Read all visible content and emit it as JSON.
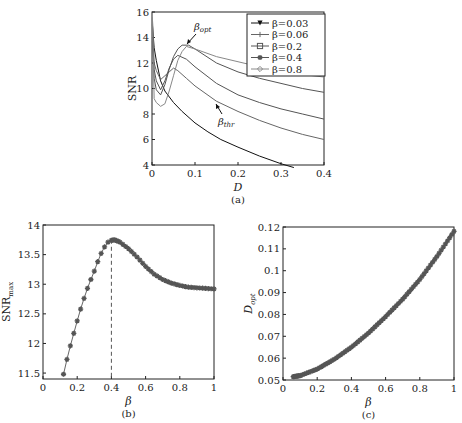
{
  "chart_data": [
    {
      "id": "a",
      "type": "line",
      "caption": "(a)",
      "xlabel": "D",
      "ylabel": "SNR",
      "xlim": [
        0,
        0.4
      ],
      "ylim": [
        4,
        16
      ],
      "xticks": [
        "0",
        "0.1",
        "0.2",
        "0.3",
        "0.4"
      ],
      "yticks": [
        "4",
        "6",
        "8",
        "10",
        "12",
        "14",
        "16"
      ],
      "legend_position": "upper right",
      "annotations": [
        {
          "text": "β_opt",
          "x": 0.085,
          "y": 13.4
        },
        {
          "text": "β_thr",
          "x": 0.155,
          "y": 8.6
        }
      ],
      "series": [
        {
          "name": "β=0.03",
          "marker": "triangle-down",
          "x": [
            0.001,
            0.005,
            0.01,
            0.02,
            0.03,
            0.05,
            0.07,
            0.1,
            0.13,
            0.16,
            0.2,
            0.25,
            0.3,
            0.33
          ],
          "y": [
            15.0,
            13.2,
            12.2,
            10.6,
            9.8,
            8.9,
            8.2,
            7.3,
            6.6,
            6.0,
            5.4,
            4.7,
            4.1,
            3.8
          ]
        },
        {
          "name": "β=0.06",
          "marker": "plus",
          "x": [
            0.001,
            0.005,
            0.01,
            0.02,
            0.03,
            0.04,
            0.05,
            0.06,
            0.08,
            0.1,
            0.15,
            0.2,
            0.25,
            0.3,
            0.35,
            0.4
          ],
          "y": [
            15.5,
            12.0,
            11.4,
            10.7,
            11.0,
            11.3,
            11.6,
            11.4,
            10.8,
            10.2,
            9.0,
            8.2,
            7.5,
            6.9,
            6.4,
            6.0
          ]
        },
        {
          "name": "β=0.2",
          "marker": "square",
          "x": [
            0.001,
            0.005,
            0.01,
            0.02,
            0.03,
            0.04,
            0.05,
            0.06,
            0.08,
            0.1,
            0.15,
            0.2,
            0.25,
            0.3,
            0.35,
            0.4
          ],
          "y": [
            14.0,
            11.5,
            10.6,
            9.9,
            10.6,
            11.6,
            12.3,
            12.6,
            12.3,
            11.7,
            10.4,
            9.5,
            8.9,
            8.4,
            8.0,
            7.6
          ]
        },
        {
          "name": "β=0.4",
          "marker": "star",
          "x": [
            0.001,
            0.005,
            0.01,
            0.02,
            0.03,
            0.04,
            0.05,
            0.06,
            0.07,
            0.085,
            0.1,
            0.15,
            0.2,
            0.25,
            0.3,
            0.35,
            0.4
          ],
          "y": [
            13.7,
            10.8,
            9.9,
            9.5,
            10.3,
            11.5,
            12.5,
            13.1,
            13.4,
            13.4,
            13.1,
            12.0,
            11.3,
            10.8,
            10.4,
            10.0,
            9.7
          ]
        },
        {
          "name": "β=0.8",
          "marker": "diamond",
          "x": [
            0.001,
            0.005,
            0.01,
            0.02,
            0.03,
            0.04,
            0.05,
            0.06,
            0.07,
            0.08,
            0.1,
            0.15,
            0.2,
            0.25,
            0.3,
            0.35,
            0.4
          ],
          "y": [
            15.6,
            9.2,
            8.9,
            8.6,
            8.8,
            9.8,
            11.0,
            12.2,
            12.9,
            13.3,
            13.1,
            12.5,
            12.1,
            11.7,
            11.4,
            11.1,
            10.9
          ]
        }
      ]
    },
    {
      "id": "b",
      "type": "line",
      "caption": "(b)",
      "xlabel": "β",
      "ylabel": "SNR_max",
      "xlim": [
        0,
        1
      ],
      "ylim": [
        11.4,
        14
      ],
      "xticks": [
        "0",
        "0.2",
        "0.4",
        "0.6",
        "0.8",
        "1"
      ],
      "yticks": [
        "11.5",
        "12",
        "12.5",
        "13",
        "13.5",
        "14"
      ],
      "annotations": [
        {
          "text": "dashed line at β=0.4",
          "x": 0.4
        }
      ],
      "x": [
        0.12,
        0.14,
        0.16,
        0.18,
        0.2,
        0.22,
        0.24,
        0.26,
        0.28,
        0.3,
        0.32,
        0.34,
        0.36,
        0.38,
        0.4,
        0.42,
        0.45,
        0.5,
        0.55,
        0.6,
        0.65,
        0.7,
        0.75,
        0.8,
        0.85,
        0.9,
        0.95,
        1.0
      ],
      "y": [
        11.48,
        11.73,
        11.96,
        12.17,
        12.38,
        12.58,
        12.76,
        12.93,
        13.08,
        13.22,
        13.38,
        13.52,
        13.63,
        13.71,
        13.74,
        13.75,
        13.71,
        13.6,
        13.46,
        13.3,
        13.17,
        13.08,
        13.02,
        12.98,
        12.95,
        12.94,
        12.93,
        12.92
      ]
    },
    {
      "id": "c",
      "type": "line",
      "caption": "(c)",
      "xlabel": "β",
      "ylabel": "D_opt",
      "xlim": [
        0,
        1
      ],
      "ylim": [
        0.05,
        0.12
      ],
      "xticks": [
        "0",
        "0.2",
        "0.4",
        "0.6",
        "0.8",
        "1"
      ],
      "yticks": [
        "0.05",
        "0.06",
        "0.07",
        "0.08",
        "0.09",
        "0.1",
        "0.11",
        "0.12"
      ],
      "x": [
        0.06,
        0.1,
        0.2,
        0.3,
        0.4,
        0.5,
        0.6,
        0.7,
        0.8,
        0.9,
        1.0
      ],
      "y": [
        0.0515,
        0.052,
        0.055,
        0.0595,
        0.065,
        0.0715,
        0.079,
        0.087,
        0.096,
        0.1065,
        0.118
      ]
    }
  ]
}
